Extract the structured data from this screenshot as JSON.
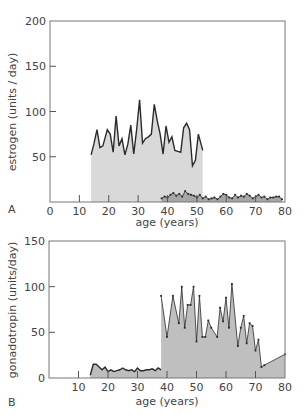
{
  "colors": {
    "frame": "#777777",
    "light_fill": "#d9d9d9",
    "dark_fill": "#a6a6a6",
    "line": "#2a2a2a"
  },
  "chart_data": [
    {
      "panel": "A",
      "type": "area",
      "xlabel": "age (years)",
      "ylabel": "estrogen (units / day)",
      "xlim": [
        0,
        80
      ],
      "ylim": [
        0,
        200
      ],
      "xticks": [
        0,
        10,
        20,
        30,
        40,
        50,
        60,
        70,
        80
      ],
      "yticks": [
        50,
        100,
        150,
        200
      ],
      "series": [
        {
          "name": "reproductive years",
          "style": "light",
          "x": [
            14,
            15,
            16,
            17,
            18,
            19.5,
            20.5,
            21.5,
            22.5,
            23.5,
            24.5,
            25.5,
            26.5,
            27.5,
            28.5,
            29.5,
            30.5,
            31.5,
            32.5,
            33.5,
            34.5,
            35.5,
            36.5,
            37.5,
            38.5,
            39.5,
            40.5,
            41.5,
            42.5,
            43.5,
            44.5,
            45.5,
            46.5,
            47.5,
            48.5,
            49.5,
            50.5,
            52
          ],
          "y": [
            52,
            65,
            80,
            60,
            62,
            80,
            75,
            55,
            95,
            62,
            70,
            52,
            64,
            85,
            53,
            80,
            113,
            65,
            70,
            72,
            75,
            108,
            90,
            75,
            53,
            84,
            66,
            72,
            57,
            56,
            55,
            82,
            87,
            80,
            40,
            46,
            75,
            57
          ]
        },
        {
          "name": "postmenopausal",
          "style": "dark",
          "x": [
            38,
            39,
            40,
            41,
            42,
            43,
            44,
            45,
            46,
            47,
            48,
            49,
            50,
            51,
            52,
            53,
            54,
            55,
            56,
            57,
            58,
            59,
            60,
            61,
            62,
            63,
            64,
            65,
            66,
            67,
            68,
            69,
            70,
            71,
            72,
            73,
            74,
            75,
            76,
            77,
            78,
            79
          ],
          "y": [
            4,
            6,
            5,
            8,
            10,
            7,
            9,
            6,
            12,
            9,
            8,
            7,
            5,
            8,
            4,
            6,
            3,
            4,
            5,
            3,
            6,
            9,
            8,
            5,
            4,
            8,
            5,
            7,
            6,
            9,
            7,
            4,
            6,
            8,
            5,
            6,
            3,
            5,
            5,
            6,
            6,
            3
          ]
        }
      ]
    },
    {
      "panel": "B",
      "type": "area",
      "xlabel": "age (years)",
      "ylabel": "gonadotropin (units/day)",
      "xlim": [
        0,
        80
      ],
      "ylim": [
        0,
        150
      ],
      "xticks": [
        10,
        20,
        30,
        40,
        50,
        60,
        70,
        80
      ],
      "yticks": [
        0,
        50,
        100,
        150
      ],
      "series": [
        {
          "name": "reproductive years",
          "style": "dark-line",
          "x": [
            14,
            15,
            16,
            17,
            18,
            19,
            20,
            21,
            22,
            23,
            24,
            25,
            26,
            27,
            28,
            29,
            30,
            31,
            32,
            33,
            34,
            35,
            36,
            37,
            38,
            39,
            40,
            41,
            42,
            43,
            44,
            45,
            46,
            47,
            48,
            49,
            50
          ],
          "y": [
            3,
            15,
            15,
            12,
            9,
            12,
            7,
            9,
            7,
            8,
            9,
            11,
            9,
            8,
            9,
            7,
            11,
            8,
            8,
            9,
            9,
            10,
            8,
            11,
            9,
            12,
            11,
            12,
            8,
            12,
            12,
            13,
            13,
            15,
            15,
            14,
            17
          ]
        },
        {
          "name": "postmenopausal",
          "style": "medium-points",
          "x": [
            38,
            40,
            42,
            44,
            45,
            46,
            47,
            48,
            49,
            50,
            51,
            52,
            53,
            54,
            55,
            57,
            58,
            59,
            60,
            61,
            62,
            64,
            65,
            66,
            67,
            68,
            69,
            70,
            71,
            72,
            73,
            80
          ],
          "y": [
            90,
            45,
            90,
            60,
            100,
            55,
            80,
            80,
            100,
            40,
            90,
            45,
            45,
            63,
            55,
            45,
            77,
            62,
            88,
            55,
            103,
            35,
            55,
            68,
            38,
            60,
            57,
            30,
            42,
            12,
            14,
            26
          ]
        }
      ]
    }
  ],
  "labels": {
    "panel_a": "A",
    "panel_b": "B",
    "xlabel_a": "age (years)",
    "xlabel_b": "age (years)",
    "ylabel_a": "estrogen (units / day)",
    "ylabel_b": "gonadotropin (units/day)"
  }
}
